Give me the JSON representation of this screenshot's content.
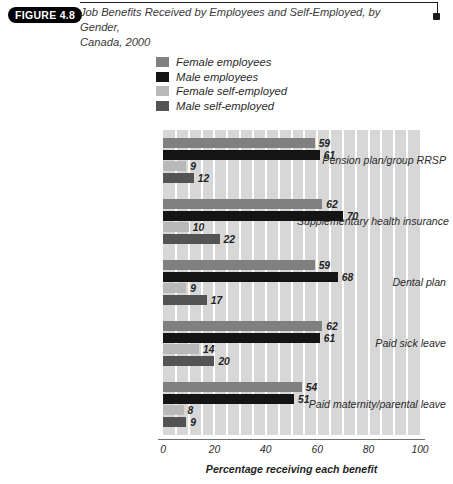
{
  "figure": {
    "badge": "FIGURE 4.8",
    "title_line1": "Job Benefits Received by Employees and Self-Employed, by Gender,",
    "title_line2": "Canada, 2000"
  },
  "legend": {
    "items": [
      {
        "label": "Female employees",
        "color": "#808080"
      },
      {
        "label": "Male employees",
        "color": "#141414"
      },
      {
        "label": "Female self-employed",
        "color": "#b9b9b9"
      },
      {
        "label": "Male self-employed",
        "color": "#545454"
      }
    ]
  },
  "chart_data": {
    "type": "bar",
    "orientation": "horizontal",
    "title": "Job Benefits Received by Employees and Self-Employed, by Gender, Canada, 2000",
    "xlabel": "Percentage receiving each benefit",
    "ylabel": "",
    "xlim": [
      0,
      100
    ],
    "xticks": [
      0,
      20,
      40,
      60,
      80,
      100
    ],
    "xtick_labels": [
      "0",
      "20",
      "40",
      "60",
      "80",
      "100"
    ],
    "grid": true,
    "grid_interval": 5,
    "legend_position": "top",
    "categories": [
      "Pension plan/group RRSP",
      "Supplementary health insurance",
      "Dental plan",
      "Paid sick leave",
      "Paid maternity/parental leave"
    ],
    "series": [
      {
        "name": "Female employees",
        "color": "#808080",
        "values": [
          59,
          62,
          59,
          62,
          54
        ]
      },
      {
        "name": "Male employees",
        "color": "#141414",
        "values": [
          61,
          70,
          68,
          61,
          51
        ]
      },
      {
        "name": "Female self-employed",
        "color": "#b9b9b9",
        "values": [
          9,
          10,
          9,
          14,
          8
        ]
      },
      {
        "name": "Male self-employed",
        "color": "#545454",
        "values": [
          12,
          22,
          17,
          20,
          9
        ]
      }
    ]
  }
}
